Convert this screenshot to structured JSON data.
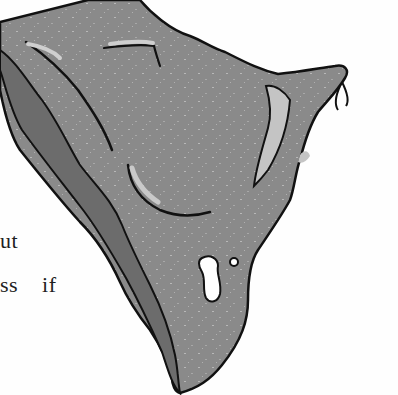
{
  "page": {
    "text_fragments": [
      {
        "text": "ut"
      },
      {
        "text": "ss  if"
      }
    ],
    "illustration": {
      "subject": "crumpled-cloth-drawing",
      "colors": {
        "fill": "#8a8a8a",
        "shadow": "#6c6c6c",
        "highlight": "#c4c4c4",
        "outline": "#111111",
        "background": "#fefefe"
      }
    }
  }
}
